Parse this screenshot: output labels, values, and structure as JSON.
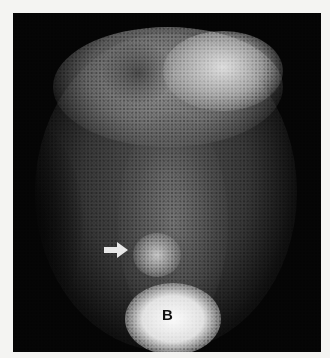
{
  "figure": {
    "annotations": {
      "arrow": {
        "direction": "right",
        "color": "#e8e8e8"
      },
      "label_b": "B"
    },
    "colors": {
      "background": "#050505",
      "page": "#f4f4f2",
      "activity_max": "#fafafa"
    }
  }
}
